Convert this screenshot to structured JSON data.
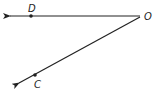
{
  "diagram": {
    "type": "geometry-angle",
    "vertex": {
      "label": "O",
      "x": 140,
      "y": 16
    },
    "rays": [
      {
        "name": "ray-OD",
        "from": "O",
        "through": "D",
        "end": [
          8,
          16
        ]
      },
      {
        "name": "ray-OC",
        "from": "O",
        "through": "C",
        "end": [
          17,
          84
        ]
      }
    ],
    "points": [
      {
        "label": "D",
        "x": 31,
        "y": 16,
        "label_x": 28,
        "label_y": 11
      },
      {
        "label": "C",
        "x": 35,
        "y": 76,
        "label_x": 36,
        "label_y": 88
      }
    ],
    "labels": {
      "vertex": "O",
      "point_d": "D",
      "point_c": "C"
    },
    "colors": {
      "stroke": "#222222",
      "background": "#ffffff"
    }
  }
}
